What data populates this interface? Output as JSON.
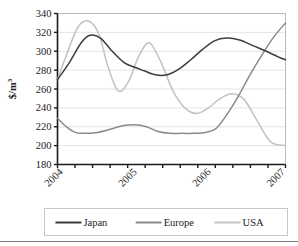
{
  "chart_data": {
    "type": "line",
    "title": "",
    "xlabel": "",
    "ylabel": "$/m",
    "ylabel_superscript": "3",
    "ylim": [
      180,
      340
    ],
    "yticks": [
      180,
      200,
      220,
      240,
      260,
      280,
      300,
      320,
      340
    ],
    "ytick_labels": [
      "180",
      "200",
      "220",
      "240",
      "260",
      "280",
      "300",
      "320",
      "340"
    ],
    "xlim": [
      2003.92,
      2007.0
    ],
    "xtick_labels": [
      "2004",
      "2005",
      "2006",
      "2007"
    ],
    "xtick_values": [
      2004,
      2005,
      2006,
      2007
    ],
    "minor_tick_count": 13,
    "grid": "horizontal",
    "legend_position": "bottom",
    "legend_entries": [
      "Japan",
      "Europe",
      "USA"
    ],
    "colors": {
      "japan": "#3d3d3d",
      "europe": "#8a8a8a",
      "usa": "#c2c2c2",
      "axis": "#1a1a1a",
      "grid": "#e4e4e4",
      "legend_border": "#c8c8c8",
      "bottom_rule": "#7a7a7a"
    },
    "series": [
      {
        "name": "Japan",
        "color_key": "japan",
        "x": [
          2003.92,
          2004.08,
          2004.24,
          2004.36,
          2004.5,
          2004.66,
          2004.82,
          2004.96,
          2005.1,
          2005.24,
          2005.4,
          2005.56,
          2005.72,
          2005.88,
          2006.04,
          2006.2,
          2006.38,
          2006.56,
          2006.74,
          2006.9,
          2007.0
        ],
        "y": [
          270,
          288,
          309,
          317,
          314,
          300,
          288,
          283,
          279,
          275,
          275,
          281,
          291,
          302,
          311,
          314,
          312,
          306,
          300,
          294,
          291
        ]
      },
      {
        "name": "Europe",
        "color_key": "europe",
        "x": [
          2003.92,
          2004.04,
          2004.16,
          2004.3,
          2004.46,
          2004.62,
          2004.8,
          2004.96,
          2005.12,
          2005.28,
          2005.44,
          2005.6,
          2005.76,
          2005.92,
          2006.06,
          2006.2,
          2006.36,
          2006.52,
          2006.68,
          2006.84,
          2007.0
        ],
        "y": [
          229,
          220,
          214,
          213,
          214,
          217,
          221,
          222,
          220,
          215,
          213,
          213,
          213,
          214,
          218,
          232,
          252,
          275,
          296,
          315,
          330
        ]
      },
      {
        "name": "USA",
        "color_key": "usa",
        "x": [
          2003.92,
          2004.06,
          2004.2,
          2004.34,
          2004.48,
          2004.6,
          2004.74,
          2004.88,
          2005.02,
          2005.16,
          2005.32,
          2005.48,
          2005.64,
          2005.8,
          2005.96,
          2006.12,
          2006.28,
          2006.44,
          2006.62,
          2006.8,
          2007.0
        ],
        "y": [
          270,
          300,
          326,
          332,
          318,
          284,
          258,
          268,
          295,
          309,
          288,
          258,
          240,
          234,
          240,
          250,
          255,
          249,
          226,
          204,
          200
        ]
      }
    ],
    "usa_tail_x": [
      2006.8,
      2006.9,
      2007.0
    ],
    "usa_tail_y": [
      200,
      200,
      204
    ]
  }
}
